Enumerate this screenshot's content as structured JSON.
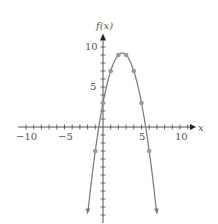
{
  "chart_data": {
    "type": "line",
    "title": "",
    "xlabel": "x",
    "ylabel": "f(x)",
    "function": "f(x) = -x^2 + 5x + 3",
    "xlim": [
      -11,
      12
    ],
    "ylim": [
      -11,
      11
    ],
    "x_ticks": [
      -10,
      -5,
      5,
      10
    ],
    "y_ticks": [
      5,
      10
    ],
    "grid": false,
    "points": [
      {
        "x": -1,
        "y": -3
      },
      {
        "x": 0,
        "y": 3
      },
      {
        "x": 1,
        "y": 7
      },
      {
        "x": 2,
        "y": 9
      },
      {
        "x": 3,
        "y": 9
      },
      {
        "x": 4,
        "y": 7
      },
      {
        "x": 5,
        "y": 3
      },
      {
        "x": 6,
        "y": -3
      }
    ],
    "curve_x_range": [
      -1.95,
      6.95
    ],
    "colors": {
      "axis": "#444444",
      "curve": "#777777",
      "points": "#999999"
    }
  },
  "labels": {
    "x_axis": "x",
    "y_axis": "f(x)",
    "x_tick_neg10": "−10",
    "x_tick_neg5": "−5",
    "x_tick_5": "5",
    "x_tick_10": "10",
    "y_tick_5": "5",
    "y_tick_10": "10"
  }
}
